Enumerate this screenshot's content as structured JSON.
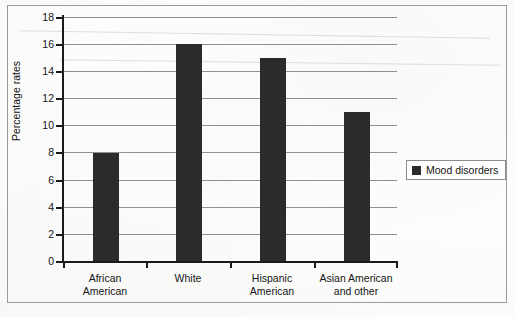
{
  "chart_data": {
    "type": "bar",
    "title": "",
    "subtitle": "",
    "xlabel": "",
    "ylabel": "Percentage rates",
    "categories": [
      "African\nAmerican",
      "White",
      "Hispanic\nAmerican",
      "Asian American\nand other"
    ],
    "values": [
      8,
      16,
      15,
      11
    ],
    "series": [
      {
        "name": "Mood disorders",
        "values": [
          8,
          16,
          15,
          11
        ]
      }
    ],
    "ylim": [
      0,
      18
    ],
    "yticks": [
      0,
      2,
      4,
      6,
      8,
      10,
      12,
      14,
      16,
      18
    ],
    "ytick_labels": [
      "0",
      "2",
      "4",
      "6",
      "8",
      "10",
      "12",
      "14",
      "16",
      "18"
    ],
    "grid": true,
    "grid_axis": "y",
    "legend": {
      "position": "right",
      "entries": [
        {
          "label": "Mood disorders",
          "color": "#2b2b2b",
          "marker": "square"
        }
      ]
    },
    "bar_color": "#2b2b2b",
    "axis_color": "#1a1a1a",
    "grid_color": "#8f8f8f",
    "background_color": "#fdfdfc",
    "frame_border_color": "#9a9a9a"
  }
}
